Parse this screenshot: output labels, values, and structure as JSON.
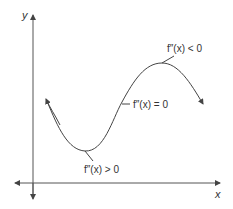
{
  "diagram": {
    "title": "",
    "axes": {
      "x_label": "x",
      "y_label": "y"
    },
    "annotations": [
      {
        "id": "max",
        "text": "f″(x) < 0",
        "position": "local maximum (concave down)"
      },
      {
        "id": "inflection",
        "text": "f″(x) = 0",
        "position": "point of inflection"
      },
      {
        "id": "min",
        "text": "f″(x) > 0",
        "position": "local minimum (concave up)"
      }
    ],
    "curve": {
      "description": "cubic-shaped curve with local minimum, inflection point and local maximum; arrows on both ends",
      "color": "#444444"
    },
    "axis_color": "#555555"
  }
}
